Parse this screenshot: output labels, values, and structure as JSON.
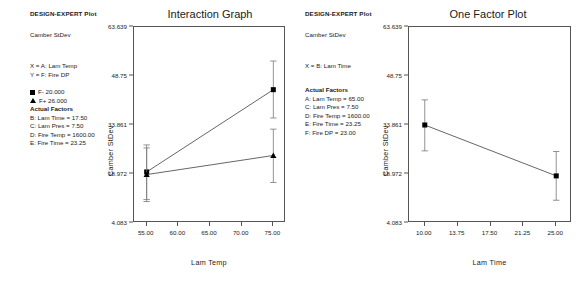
{
  "panels": [
    {
      "id": "interaction",
      "header": "DESIGN-EXPERT Plot",
      "response": "Camber StDev",
      "axis_defs": [
        "X = A: Lam Temp",
        "Y = F: Fire DP"
      ],
      "legend": [
        {
          "symbol": "square",
          "label": "F- 20.000"
        },
        {
          "symbol": "triangle",
          "label": "F+ 26.000"
        }
      ],
      "actual_factors_heading": "Actual Factors",
      "actual_factors": [
        "B: Lam Time = 17.50",
        "C: Lam Pres = 7.50",
        "D: Fire Temp = 1600.00",
        "E: Fire Time = 23.25"
      ],
      "title": "Interaction Graph",
      "subtitle": "Fire DP",
      "xlabel": "Lam Temp",
      "ylabel": "Camber StDev"
    },
    {
      "id": "onefactor",
      "header": "DESIGN-EXPERT Plot",
      "response": "Camber StDev",
      "axis_defs": [
        "X = B: Lam Time"
      ],
      "legend": [],
      "actual_factors_heading": "Actual Factors",
      "actual_factors": [
        "A: Lam Temp = 65.00",
        "C: Lam Pres = 7.50",
        "D: Fire Temp = 1600.00",
        "E: Fire Time = 23.25",
        "F: Fire DP = 23.00"
      ],
      "title": "One Factor Plot",
      "subtitle": "",
      "xlabel": "Lam Time",
      "ylabel": "Camber StDev"
    }
  ],
  "chart_data": [
    {
      "type": "line",
      "title": "Interaction Graph",
      "subtitle": "Fire DP",
      "xlabel": "Lam Temp",
      "ylabel": "Camber StDev",
      "xlim": [
        53.0,
        77.0
      ],
      "ylim": [
        4.083,
        63.639
      ],
      "xticks": [
        55.0,
        60.0,
        65.0,
        70.0,
        75.0
      ],
      "xtick_labels": [
        "55.00",
        "60.00",
        "65.00",
        "70.00",
        "75.00"
      ],
      "yticks": [
        4.083,
        18.972,
        33.861,
        48.75,
        63.639
      ],
      "ytick_labels": [
        "4.083",
        "18.972",
        "33.861",
        "48.75",
        "63.639"
      ],
      "grid": false,
      "legend_position": "outside-left",
      "series": [
        {
          "name": "F- 20.000",
          "marker": "square",
          "line": "solid",
          "x": [
            55.0,
            75.0
          ],
          "values": [
            19.6,
            44.6
          ],
          "err_low": [
            11.2,
            36.0
          ],
          "err_high": [
            27.8,
            53.3
          ]
        },
        {
          "name": "F+ 26.000",
          "marker": "triangle",
          "line": "solid",
          "x": [
            55.0,
            75.0
          ],
          "values": [
            18.8,
            24.6
          ],
          "err_low": [
            10.6,
            16.4
          ],
          "err_high": [
            26.9,
            32.6
          ]
        }
      ]
    },
    {
      "type": "line",
      "title": "One Factor Plot",
      "subtitle": "",
      "xlabel": "Lam Time",
      "ylabel": "Camber StDev",
      "xlim": [
        8.2,
        26.8
      ],
      "ylim": [
        4.083,
        63.639
      ],
      "xticks": [
        10.0,
        13.75,
        17.5,
        21.25,
        25.0
      ],
      "xtick_labels": [
        "10.00",
        "13.75",
        "17.50",
        "21.25",
        "25.00"
      ],
      "yticks": [
        4.083,
        18.972,
        33.861,
        48.75,
        63.639
      ],
      "ytick_labels": [
        "4.083",
        "18.972",
        "33.861",
        "48.75",
        "63.639"
      ],
      "grid": false,
      "legend_position": "none",
      "series": [
        {
          "name": "Camber StDev",
          "marker": "square",
          "line": "solid",
          "x": [
            10.0,
            25.0
          ],
          "values": [
            33.861,
            18.4
          ],
          "err_low": [
            26.0,
            11.0
          ],
          "err_high": [
            41.5,
            25.8
          ]
        }
      ]
    }
  ]
}
